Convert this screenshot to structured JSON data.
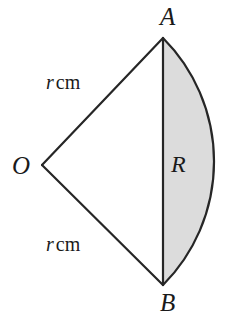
{
  "figure": {
    "background_color": "#ffffff",
    "stroke_color": "#262626",
    "segment_fill_color": "#dcdcdc",
    "triangle_fill_color": "#ffffff",
    "stroke_width": 2.2,
    "labels": {
      "vertex_o": "O",
      "vertex_a": "A",
      "vertex_b": "B",
      "region": "R",
      "radius_top_symbol": "r",
      "radius_top_unit": "cm",
      "radius_bottom_symbol": "r",
      "radius_bottom_unit": "cm"
    },
    "geometry": {
      "centre_o": {
        "x": 42,
        "y": 165
      },
      "point_a": {
        "x": 163,
        "y": 38
      },
      "point_b": {
        "x": 163,
        "y": 285
      },
      "arc_apex": {
        "x": 212,
        "y": 165
      },
      "chord_x": 163,
      "radius_px": 175
    }
  }
}
